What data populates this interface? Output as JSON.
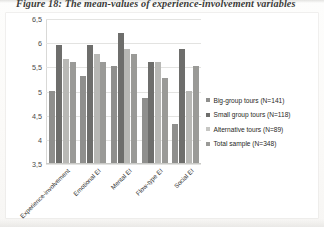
{
  "figure": {
    "caption": "Figure 18: The mean-values of experience-involvement variables"
  },
  "legend": {
    "position": "right",
    "items": [
      {
        "label": "Big-group tours (N=141)",
        "swatch": "s0"
      },
      {
        "label": "Small group tours (N=118)",
        "swatch": "s1"
      },
      {
        "label": "Alternative tours (N=89)",
        "swatch": "s2"
      },
      {
        "label": "Total sample (N=348)",
        "swatch": "s3"
      }
    ]
  },
  "axis": {
    "y_ticks": [
      "6,5",
      "6",
      "5,5",
      "5",
      "4,5",
      "4",
      "3,5"
    ]
  },
  "chart_data": {
    "type": "bar",
    "title": "Figure 18: The mean-values of experience-involvement variables",
    "xlabel": "",
    "ylabel": "",
    "ylim": [
      3.5,
      6.5
    ],
    "ytick_values": [
      6.5,
      6.0,
      5.5,
      5.0,
      4.5,
      4.0,
      3.5
    ],
    "ytick_labels": [
      "6,5",
      "6",
      "5,5",
      "5",
      "4,5",
      "4",
      "3,5"
    ],
    "grid": true,
    "legend_position": "right",
    "categories": [
      "Experience-involvement",
      "Emotional EI",
      "Mental EI",
      "Flow-type EI",
      "Social EI"
    ],
    "series": [
      {
        "name": "Big-group tours (N=141)",
        "values": [
          5.0,
          5.3,
          5.5,
          4.85,
          4.3
        ]
      },
      {
        "name": "Small group tours (N=118)",
        "values": [
          5.95,
          5.95,
          6.2,
          5.6,
          5.85
        ]
      },
      {
        "name": "Alternative tours (N=89)",
        "values": [
          5.65,
          5.75,
          5.85,
          5.6,
          5.0
        ]
      },
      {
        "name": "Total sample (N=348)",
        "values": [
          5.6,
          5.6,
          5.75,
          5.25,
          5.5
        ]
      }
    ]
  }
}
